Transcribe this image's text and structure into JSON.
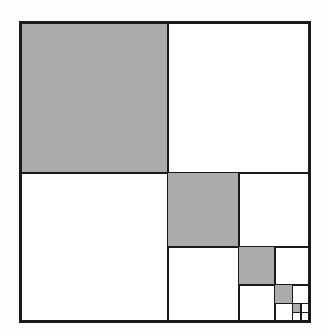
{
  "figure": {
    "canvas": {
      "width": 322,
      "height": 336
    },
    "background_color": "#fdfdfd"
  },
  "style": {
    "fill_shaded": "#ababab",
    "fill_empty": "#ffffff",
    "stroke_color": "#1a1a1a",
    "stroke_width_outer": 2.2,
    "stroke_width_inner": 2.0,
    "stroke_width_deep": 1.4
  },
  "square": {
    "x": 20.5,
    "y": 22.5,
    "width": 289,
    "height": 299
  },
  "recursion": {
    "levels": 5,
    "shaded_quadrant": "top-left",
    "recursed_quadrant": "bottom-right",
    "split_ratio_x": 0.511,
    "split_ratio_y": 0.503
  },
  "levels": [
    {
      "level": 1,
      "x": 20.5,
      "y": 22.5,
      "width": 289,
      "height": 299,
      "split_x": 168.0,
      "split_y": 173.0,
      "stroke_width": 2.2,
      "shaded": {
        "x": 20.5,
        "y": 22.5,
        "width": 147.5,
        "height": 150.5
      },
      "label": "quadrant-level-1"
    },
    {
      "level": 2,
      "x": 168.0,
      "y": 173.0,
      "width": 141.5,
      "height": 148.5,
      "split_x": 239.0,
      "split_y": 247.0,
      "stroke_width": 2.0,
      "shaded": {
        "x": 168.0,
        "y": 173.0,
        "width": 71.0,
        "height": 74.0
      },
      "label": "quadrant-level-2"
    },
    {
      "level": 3,
      "x": 239.0,
      "y": 247.0,
      "width": 70.5,
      "height": 74.5,
      "split_x": 275.0,
      "split_y": 285.0,
      "stroke_width": 1.8,
      "shaded": {
        "x": 239.0,
        "y": 247.0,
        "width": 36.0,
        "height": 38.0
      },
      "label": "quadrant-level-3"
    },
    {
      "level": 4,
      "x": 275.0,
      "y": 285.0,
      "width": 34.5,
      "height": 36.5,
      "split_x": 292.5,
      "split_y": 303.5,
      "stroke_width": 1.5,
      "shaded": {
        "x": 275.0,
        "y": 285.0,
        "width": 17.5,
        "height": 18.5
      },
      "label": "quadrant-level-4"
    },
    {
      "level": 5,
      "x": 292.5,
      "y": 303.5,
      "width": 17.0,
      "height": 18.0,
      "split_x": 301.0,
      "split_y": 312.5,
      "stroke_width": 1.3,
      "shaded": {
        "x": 292.5,
        "y": 303.5,
        "width": 8.5,
        "height": 9.0
      },
      "label": "quadrant-level-5"
    }
  ],
  "chart_data": {
    "type": "area",
    "subtitle": "",
    "xlabel": "",
    "ylabel": "",
    "categories": [
      "level 1",
      "level 2",
      "level 3",
      "level 4",
      "level 5"
    ],
    "values": [
      0.25,
      0.0625,
      0.015625,
      0.00390625,
      0.0009765625
    ],
    "series": [
      {
        "name": "shaded area fraction of whole square",
        "values": [
          0.25,
          0.0625,
          0.015625,
          0.00390625,
          0.0009765625
        ]
      },
      {
        "name": "cumulative shaded fraction",
        "values": [
          0.25,
          0.3125,
          0.328125,
          0.33203125,
          0.3330078125
        ]
      },
      {
        "name": "side length fraction of whole square",
        "values": [
          0.5,
          0.25,
          0.125,
          0.0625,
          0.03125
        ]
      }
    ],
    "annotations": [
      "Each level shades the upper-left quadrant (1/4 of the remaining square).",
      "Series sums toward 1/3 of the total square area.",
      "Recursion continues into the lower-right quadrant."
    ],
    "grid": false,
    "legend": "none"
  }
}
